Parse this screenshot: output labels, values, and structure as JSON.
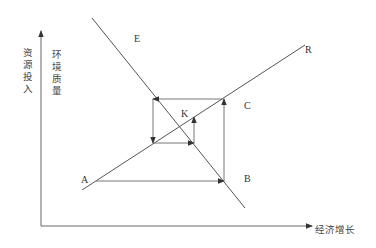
{
  "diagram": {
    "type": "cobweb-diagram",
    "y_axis_labels": [
      "资源投入",
      "环境质量"
    ],
    "x_axis_label": "经济增长",
    "curves": [
      {
        "name": "E",
        "description": "downward-sloping line",
        "x1": 92,
        "y1": 18,
        "x2": 245,
        "y2": 208
      },
      {
        "name": "R",
        "description": "upward-sloping line",
        "x1": 82,
        "y1": 190,
        "x2": 305,
        "y2": 45
      }
    ],
    "points": [
      {
        "label": "A",
        "x": 88,
        "y": 179
      },
      {
        "label": "B",
        "x": 244,
        "y": 179
      },
      {
        "label": "C",
        "x": 244,
        "y": 109
      },
      {
        "label": "E",
        "x": 136,
        "y": 41
      },
      {
        "label": "R",
        "x": 306,
        "y": 55
      },
      {
        "label": "K",
        "x": 182,
        "y": 118
      }
    ],
    "path_segments": [
      {
        "from": [
          96,
          181
        ],
        "to": [
          224,
          181
        ],
        "arrow": "end"
      },
      {
        "from": [
          224,
          181
        ],
        "to": [
          224,
          99
        ],
        "arrow": "end"
      },
      {
        "from": [
          224,
          99
        ],
        "to": [
          153,
          99
        ],
        "arrow": "end"
      },
      {
        "from": [
          153,
          99
        ],
        "to": [
          153,
          143
        ],
        "arrow": "end"
      },
      {
        "from": [
          153,
          143
        ],
        "to": [
          194,
          143
        ],
        "arrow": "end"
      },
      {
        "from": [
          194,
          143
        ],
        "to": [
          194,
          117
        ],
        "arrow": "end"
      }
    ],
    "colors": {
      "line": "#555555",
      "text": "#333333",
      "background": "#ffffff"
    }
  }
}
